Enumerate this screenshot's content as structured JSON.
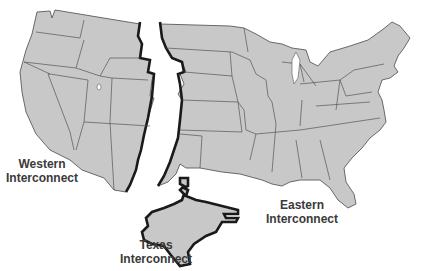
{
  "map": {
    "title": "US Power Grid Interconnections",
    "fill_color": "#c8c8c8",
    "border_color": "#1a1a1a",
    "regions": [
      {
        "id": "western",
        "line1": "Western",
        "line2": "Interconnect"
      },
      {
        "id": "eastern",
        "line1": "Eastern",
        "line2": "Interconnect"
      },
      {
        "id": "texas",
        "line1": "Texas",
        "line2": "Interconnect"
      }
    ]
  }
}
